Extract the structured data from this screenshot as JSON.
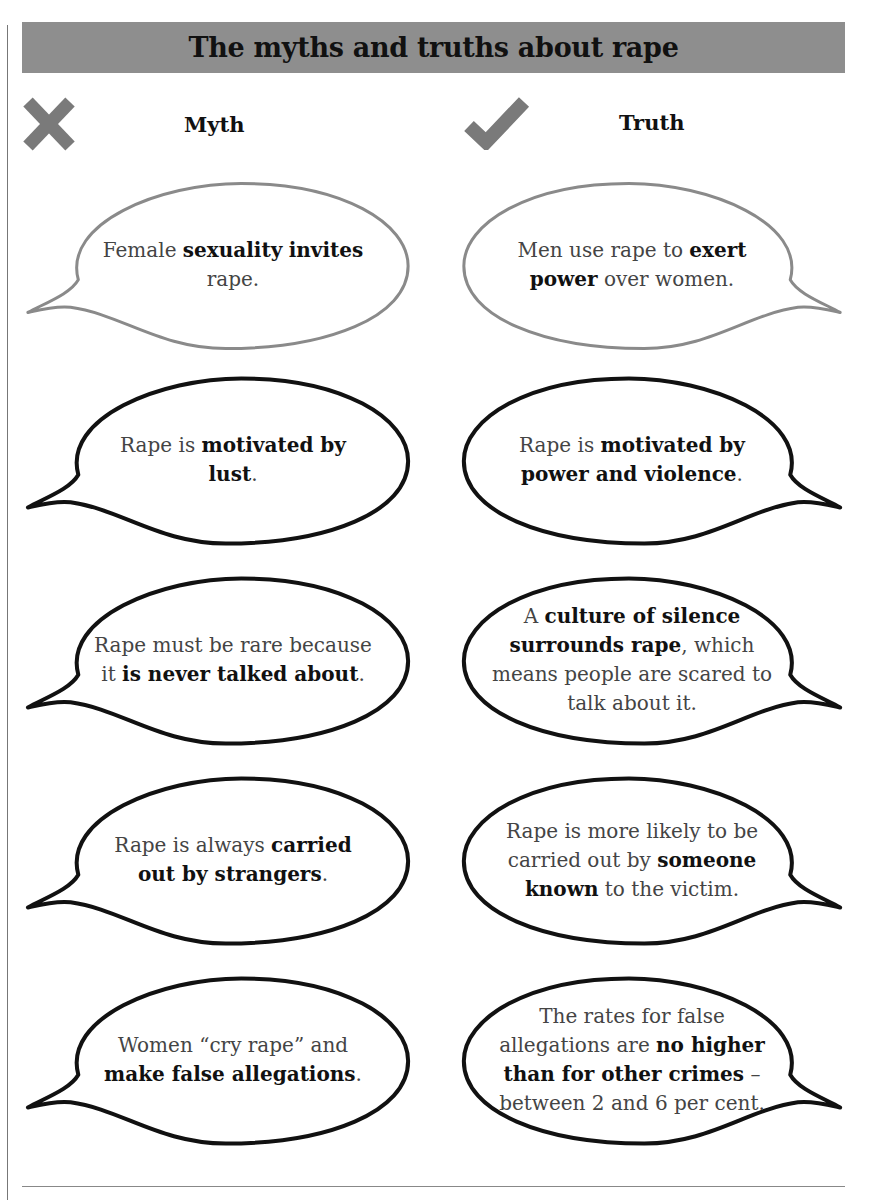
{
  "title": "The myths and truths about rape",
  "columns": {
    "myth_label": "Myth",
    "truth_label": "Truth",
    "myth_icon": "cross-icon",
    "truth_icon": "checkmark-icon",
    "icon_color": "#7a7a7a"
  },
  "colors": {
    "banner": "#8e8e8e",
    "first_row_outline": "#8a8a8a",
    "outline": "#111111"
  },
  "rows": [
    {
      "myth": [
        {
          "t": "Female ",
          "b": false
        },
        {
          "t": "sexuality",
          "b": true
        },
        {
          "t": " ",
          "b": false
        },
        {
          "t": "invites",
          "b": true
        },
        {
          "t": " rape.",
          "b": false
        }
      ],
      "truth": [
        {
          "t": "Men use rape to ",
          "b": false
        },
        {
          "t": "exert power",
          "b": true
        },
        {
          "t": " over women.",
          "b": false
        }
      ]
    },
    {
      "myth": [
        {
          "t": "Rape is ",
          "b": false
        },
        {
          "t": "motivated by lust",
          "b": true
        },
        {
          "t": ".",
          "b": false
        }
      ],
      "truth": [
        {
          "t": "Rape is ",
          "b": false
        },
        {
          "t": "motivated by power and violence",
          "b": true
        },
        {
          "t": ".",
          "b": false
        }
      ]
    },
    {
      "myth": [
        {
          "t": "Rape must be rare because it ",
          "b": false
        },
        {
          "t": "is never talked about",
          "b": true
        },
        {
          "t": ".",
          "b": false
        }
      ],
      "truth": [
        {
          "t": "A ",
          "b": false
        },
        {
          "t": "culture of silence surrounds rape",
          "b": true
        },
        {
          "t": ", which means people are scared to talk about it.",
          "b": false
        }
      ]
    },
    {
      "myth": [
        {
          "t": "Rape is always ",
          "b": false
        },
        {
          "t": "carried out by strangers",
          "b": true
        },
        {
          "t": ".",
          "b": false
        }
      ],
      "truth": [
        {
          "t": "Rape is more likely to be carried out by ",
          "b": false
        },
        {
          "t": "someone known",
          "b": true
        },
        {
          "t": " to the victim.",
          "b": false
        }
      ]
    },
    {
      "myth": [
        {
          "t": "Women “cry rape” and ",
          "b": false
        },
        {
          "t": "make false allegations",
          "b": true
        },
        {
          "t": ".",
          "b": false
        }
      ],
      "truth": [
        {
          "t": "The rates for false allegations are ",
          "b": false
        },
        {
          "t": "no higher than for other crimes",
          "b": true
        },
        {
          "t": " – between 2 and 6 per cent.",
          "b": false
        }
      ]
    }
  ]
}
